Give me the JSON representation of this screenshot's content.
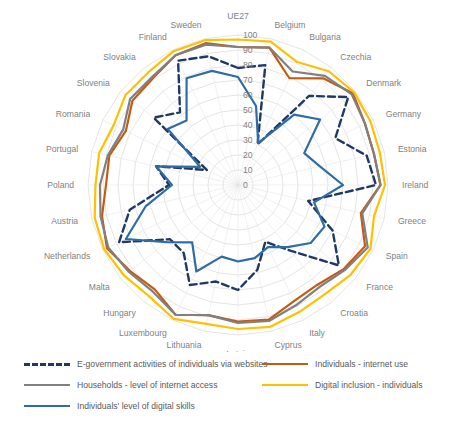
{
  "chart_data": {
    "type": "radar",
    "title": "",
    "grid": true,
    "legend_position": "bottom",
    "rlim": [
      0,
      100
    ],
    "rticks": [
      0,
      10,
      20,
      30,
      40,
      50,
      60,
      70,
      80,
      90,
      100
    ],
    "rtick_labels": [
      "0",
      "10",
      "20",
      "30",
      "40",
      "50",
      "60",
      "70",
      "80",
      "90",
      "100"
    ],
    "xlabel": "",
    "ylabel": "",
    "direction": "counterclockwise",
    "start_angle_deg": 90,
    "categories": [
      "UE27",
      "Sweden",
      "Finland",
      "Slovakia",
      "Slovenia",
      "Romania",
      "Portugal",
      "Poland",
      "Austria",
      "Netherlands",
      "Malta",
      "Hungary",
      "Luxembourg",
      "Lithuania",
      "Latvia",
      "Cyprus",
      "Italy",
      "Croatia",
      "France",
      "Spain",
      "Greece",
      "Ireland",
      "Estonia",
      "Germany",
      "Denmark",
      "Czechia",
      "Bulgaria",
      "Belgium"
    ],
    "series": [
      {
        "name": "E-government activities of individuals via websites",
        "color": "#1F3864",
        "style": "dashed",
        "values": [
          78,
          88,
          92,
          62,
          72,
          23,
          56,
          46,
          74,
          88,
          58,
          58,
          74,
          66,
          70,
          58,
          42,
          56,
          86,
          70,
          48,
          92,
          88,
          72,
          94,
          76,
          30,
          82
        ]
      },
      {
        "name": "Individuals - internet use",
        "color": "#C55A11",
        "style": "solid",
        "values": [
          92,
          97,
          96,
          91,
          90,
          83,
          88,
          88,
          93,
          97,
          92,
          89,
          96,
          89,
          91,
          92,
          86,
          85,
          90,
          94,
          84,
          95,
          93,
          94,
          98,
          91,
          79,
          94
        ]
      },
      {
        "name": "Households -  level of internet access",
        "color": "#808080",
        "style": "solid",
        "values": [
          92,
          96,
          96,
          92,
          92,
          85,
          89,
          92,
          94,
          96,
          93,
          91,
          96,
          89,
          92,
          93,
          89,
          87,
          91,
          96,
          85,
          95,
          93,
          94,
          97,
          93,
          84,
          94
        ]
      },
      {
        "name": "Digital inclusion - individuals",
        "color": "#FFC000",
        "style": "solid",
        "values": [
          97,
          99,
          99,
          96,
          96,
          92,
          95,
          95,
          98,
          99,
          97,
          95,
          99,
          95,
          96,
          97,
          94,
          93,
          96,
          98,
          93,
          98,
          97,
          98,
          99,
          97,
          91,
          98
        ]
      },
      {
        "name": "Individuals' level of digital skills",
        "color": "#2E6CA4",
        "style": "solid",
        "values": [
          72,
          78,
          79,
          55,
          60,
          28,
          56,
          44,
          63,
          83,
          61,
          49,
          64,
          49,
          51,
          50,
          46,
          53,
          62,
          64,
          52,
          70,
          56,
          49,
          70,
          60,
          31,
          54
        ]
      }
    ]
  },
  "legend": {
    "items": [
      {
        "label": "E-government activities of individuals via websites",
        "color": "#1F3864",
        "style": "dashed"
      },
      {
        "label": "Individuals - internet use",
        "color": "#C55A11",
        "style": "solid"
      },
      {
        "label": "Households -  level of internet access",
        "color": "#808080",
        "style": "solid"
      },
      {
        "label": "Digital inclusion - individuals",
        "color": "#FFC000",
        "style": "solid"
      },
      {
        "label": "Individuals' level of digital skills",
        "color": "#2E6CA4",
        "style": "solid"
      }
    ]
  }
}
